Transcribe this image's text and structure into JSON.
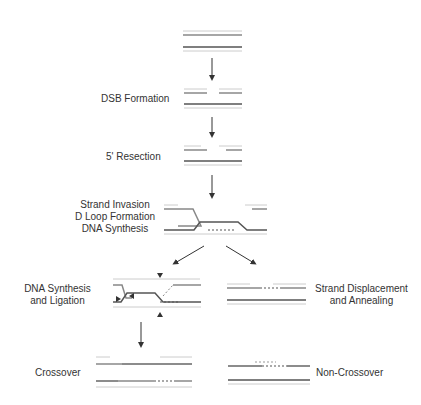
{
  "diagram": {
    "type": "DNA double-strand break repair pathway",
    "colors": {
      "strand_dark": "#555555",
      "strand_light": "#bbbbbb",
      "strand_mid": "#888888",
      "arrow": "#333333",
      "text": "#333333"
    },
    "steps": [
      {
        "id": "intact",
        "label": ""
      },
      {
        "id": "dsb",
        "label": "DSB Formation"
      },
      {
        "id": "resection",
        "label": "5' Resection"
      },
      {
        "id": "invasion",
        "label_lines": [
          "Strand Invasion",
          "D Loop Formation",
          "DNA Synthesis"
        ]
      },
      {
        "id": "dhj",
        "label_lines": [
          "DNA Synthesis",
          "and Ligation"
        ]
      },
      {
        "id": "sdsa",
        "label_lines": [
          "Strand Displacement",
          "and Annealing"
        ]
      },
      {
        "id": "crossover",
        "label": "Crossover"
      },
      {
        "id": "noncrossover",
        "label": "Non-Crossover"
      }
    ]
  }
}
